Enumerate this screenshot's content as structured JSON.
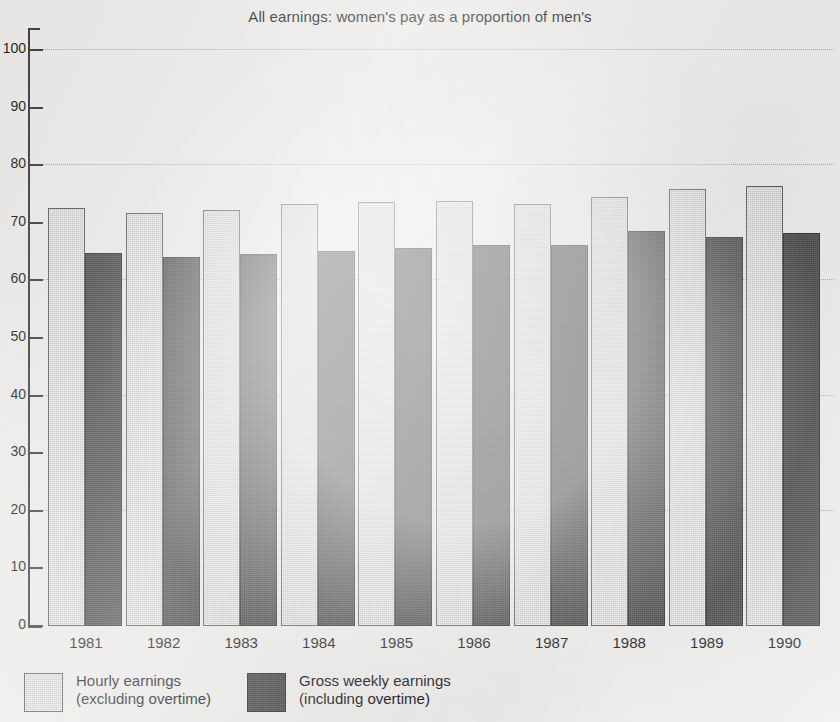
{
  "chart_data": {
    "type": "bar",
    "title": "All earnings: women's pay as a proportion of men's",
    "xlabel": "",
    "ylabel": "",
    "ylim": [
      0,
      100
    ],
    "grid": true,
    "legend_position": "bottom-left",
    "categories": [
      "1981",
      "1982",
      "1983",
      "1984",
      "1985",
      "1986",
      "1987",
      "1988",
      "1989",
      "1990"
    ],
    "series": [
      {
        "name": "Hourly earnings (excluding overtime)",
        "color": "#c9c9c7",
        "values": [
          72.5,
          71.7,
          72.2,
          73.3,
          73.7,
          73.8,
          73.3,
          74.4,
          75.8,
          76.4
        ]
      },
      {
        "name": "Gross weekly earnings (including overtime)",
        "color": "#3a3a3c",
        "values": [
          64.8,
          64.0,
          64.6,
          65.1,
          65.6,
          66.1,
          66.2,
          68.6,
          67.5,
          68.2
        ]
      }
    ],
    "y_ticks": [
      {
        "value": 100,
        "label": "100"
      },
      {
        "value": 90,
        "label": "90"
      },
      {
        "value": 80,
        "label": "80"
      },
      {
        "value": 70,
        "label": "70"
      },
      {
        "value": 60,
        "label": "60"
      },
      {
        "value": 50,
        "label": "50"
      },
      {
        "value": 40,
        "label": "40"
      },
      {
        "value": 30,
        "label": "30"
      },
      {
        "value": 20,
        "label": "20"
      },
      {
        "value": 10,
        "label": "10"
      },
      {
        "value": 0,
        "label": "0"
      }
    ]
  },
  "legend": {
    "items": [
      {
        "line1": "Hourly earnings",
        "line2": "(excluding overtime)",
        "swatch": "#c9c9c7"
      },
      {
        "line1": "Gross weekly earnings",
        "line2": "(including overtime)",
        "swatch": "#3a3a3c"
      }
    ]
  }
}
